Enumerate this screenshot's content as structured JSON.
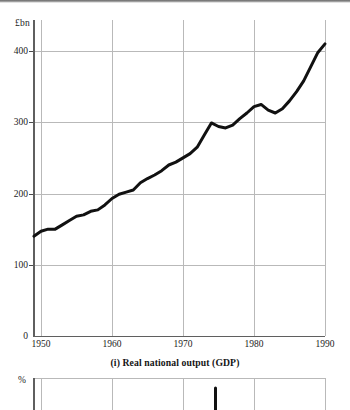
{
  "page": {
    "background": "#ffffff",
    "ink": "#1a1a1a"
  },
  "chart_data": [
    {
      "id": "gdp",
      "type": "line",
      "title": "(i)  Real national output (GDP)",
      "caption": "(i)  Real national output (GDP)",
      "xlabel": "",
      "ylabel": "£bn",
      "yunit": "£bn",
      "xlim": [
        1949,
        1990
      ],
      "ylim": [
        0,
        430
      ],
      "yticks": [
        0,
        100,
        200,
        300,
        400
      ],
      "ytick_labels": [
        "0",
        "100",
        "200",
        "300",
        "400"
      ],
      "xticks": [
        1950,
        1960,
        1970,
        1980,
        1990
      ],
      "xtick_labels": [
        "1950",
        "1960",
        "1970",
        "1980",
        "1990"
      ],
      "grid": "both",
      "legend": "none",
      "line_color": "#111111",
      "line_width": 3,
      "x": [
        1949,
        1950,
        1951,
        1952,
        1953,
        1954,
        1955,
        1956,
        1957,
        1958,
        1959,
        1960,
        1961,
        1962,
        1963,
        1964,
        1965,
        1966,
        1967,
        1968,
        1969,
        1970,
        1971,
        1972,
        1973,
        1974,
        1975,
        1976,
        1977,
        1978,
        1979,
        1980,
        1981,
        1982,
        1983,
        1984,
        1985,
        1986,
        1987,
        1988,
        1989,
        1990
      ],
      "values": [
        140,
        147,
        150,
        150,
        156,
        162,
        168,
        170,
        175,
        177,
        184,
        193,
        199,
        202,
        205,
        215,
        221,
        226,
        232,
        240,
        244,
        250,
        256,
        265,
        282,
        299,
        294,
        292,
        296,
        305,
        313,
        322,
        325,
        317,
        313,
        319,
        330,
        343,
        358,
        378,
        398,
        410
      ]
    },
    {
      "id": "percent-chart-partial",
      "type": "line",
      "title": "",
      "ylabel": "%",
      "yunit": "%",
      "grid": "both",
      "note": "second chart clipped by bottom edge of screenshot",
      "xticks": [
        1950,
        1960,
        1970,
        1980,
        1990
      ],
      "line_color": "#111111",
      "x": [
        1972.5,
        1973
      ],
      "values": [
        0,
        1
      ]
    }
  ]
}
